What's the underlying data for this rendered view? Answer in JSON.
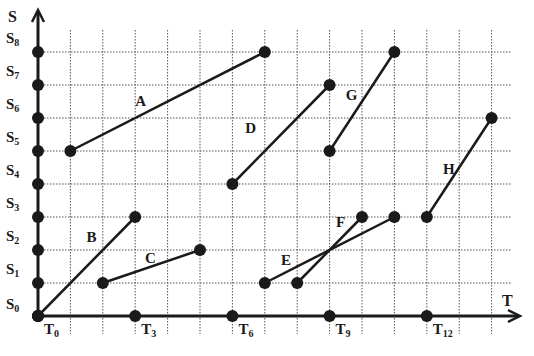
{
  "diagram": {
    "title": "",
    "axes": {
      "y_label": "S",
      "x_label": "T",
      "y_ticks": [
        {
          "main": "S",
          "sub": "0",
          "value": 0
        },
        {
          "main": "S",
          "sub": "1",
          "value": 1
        },
        {
          "main": "S",
          "sub": "2",
          "value": 2
        },
        {
          "main": "S",
          "sub": "3",
          "value": 3
        },
        {
          "main": "S",
          "sub": "4",
          "value": 4
        },
        {
          "main": "S",
          "sub": "5",
          "value": 5
        },
        {
          "main": "S",
          "sub": "6",
          "value": 6
        },
        {
          "main": "S",
          "sub": "7",
          "value": 7
        },
        {
          "main": "S",
          "sub": "8",
          "value": 8
        }
      ],
      "x_ticks": [
        {
          "main": "T",
          "sub": "0",
          "value": 0
        },
        {
          "main": "T",
          "sub": "3",
          "value": 3
        },
        {
          "main": "T",
          "sub": "6",
          "value": 6
        },
        {
          "main": "T",
          "sub": "9",
          "value": 9
        },
        {
          "main": "T",
          "sub": "12",
          "value": 12
        }
      ]
    },
    "grid": {
      "x_lines": 14,
      "y_lines": 8,
      "style": "dotted"
    },
    "segments": [
      {
        "label": "A",
        "from": [
          1,
          5
        ],
        "to": [
          7,
          8
        ],
        "label_pos": [
          3.0,
          6.35
        ]
      },
      {
        "label": "B",
        "from": [
          0,
          0
        ],
        "to": [
          3,
          3
        ],
        "label_pos": [
          1.5,
          2.25
        ]
      },
      {
        "label": "C",
        "from": [
          2,
          1
        ],
        "to": [
          5,
          2
        ],
        "label_pos": [
          3.3,
          1.6
        ]
      },
      {
        "label": "D",
        "from": [
          6,
          4
        ],
        "to": [
          9,
          7
        ],
        "label_pos": [
          6.4,
          5.55
        ]
      },
      {
        "label": "E",
        "from": [
          7,
          1
        ],
        "to": [
          11,
          3
        ],
        "label_pos": [
          7.5,
          1.55
        ]
      },
      {
        "label": "F",
        "from": [
          8,
          1
        ],
        "to": [
          10,
          3
        ],
        "label_pos": [
          9.2,
          2.7
        ]
      },
      {
        "label": "G",
        "from": [
          9,
          5
        ],
        "to": [
          11,
          8
        ],
        "label_pos": [
          9.5,
          6.55
        ]
      },
      {
        "label": "H",
        "from": [
          12,
          3
        ],
        "to": [
          14,
          6
        ],
        "label_pos": [
          12.5,
          4.3
        ]
      }
    ],
    "colors": {
      "line": "#1a1a1a",
      "grid": "#555555",
      "background": "#ffffff"
    }
  }
}
